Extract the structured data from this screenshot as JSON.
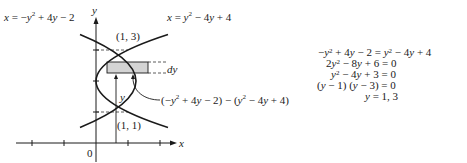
{
  "figure": {
    "axes": {
      "x_label": "x",
      "y_label": "y",
      "origin_label": "0",
      "x_ticks": [
        -2,
        -1,
        1,
        2
      ],
      "y_ticks": [
        1,
        2,
        3
      ]
    },
    "curves": [
      {
        "id": "left-opening",
        "equation_lhs": "x = ",
        "equation_rhs": "−y² + 4y − 2",
        "label": "x = −y² + 4y − 2"
      },
      {
        "id": "right-opening",
        "equation_lhs": "x = ",
        "equation_rhs": "y² − 4y + 4",
        "label": "x = y² − 4y + 4"
      }
    ],
    "intersections": [
      {
        "label": "(1, 3)",
        "x": 1,
        "y": 3
      },
      {
        "label": "(1, 1)",
        "x": 1,
        "y": 1
      }
    ],
    "strip": {
      "height_label": "dy",
      "y_label": "y",
      "length_label": "(−y² + 4y − 2) − (y² − 4y + 4)",
      "fill": "#d4d4d4"
    }
  },
  "derivation": {
    "lines": [
      "−y² + 4y − 2 = y² − 4y + 4",
      "2y² − 8y + 6 = 0",
      "y² − 4y + 3 = 0",
      "(y − 1) (y − 3) = 0",
      "y = 1, 3"
    ]
  }
}
